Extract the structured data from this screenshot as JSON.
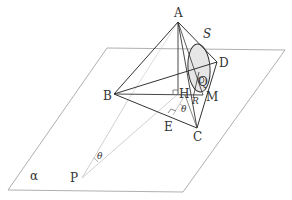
{
  "diagram": {
    "type": "solid-geometry",
    "labels": {
      "A": "A",
      "S": "S",
      "D": "D",
      "B": "B",
      "H": "H",
      "Q": "Q",
      "M": "M",
      "R": "R",
      "E": "E",
      "C": "C",
      "P": "P",
      "alpha": "α",
      "theta_top": "θ",
      "theta_bottom": "θ"
    },
    "points": {
      "A": [
        178,
        22
      ],
      "B": [
        114,
        94
      ],
      "C": [
        197,
        128
      ],
      "D": [
        217,
        62
      ],
      "H": [
        178,
        94
      ],
      "M": [
        203,
        95
      ],
      "E": [
        173,
        115
      ],
      "P": [
        82,
        178
      ],
      "Q": [
        200,
        80
      ],
      "R": [
        195,
        97
      ]
    },
    "plane": {
      "name": "α",
      "corners": [
        [
          107,
          48
        ],
        [
          285,
          50
        ],
        [
          183,
          192
        ],
        [
          8,
          190
        ]
      ]
    },
    "colors": {
      "stroke": "#333333",
      "light_stroke": "#bbbbbb",
      "plane_stroke": "#9a9a9a",
      "ellipse_fill": "#e6e6e6"
    }
  }
}
